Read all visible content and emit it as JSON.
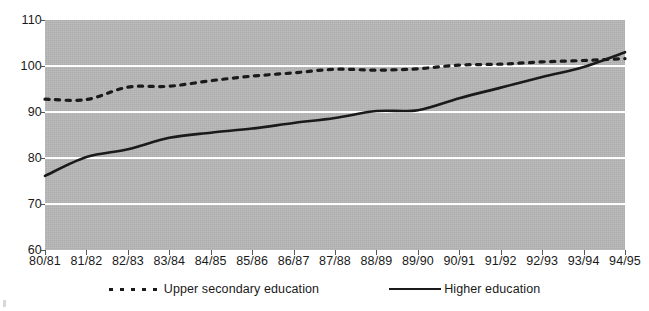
{
  "chart_data": {
    "type": "line",
    "title": "",
    "subtitle": "",
    "xlabel": "",
    "ylabel": "",
    "grid": "horizontal",
    "legend_position": "bottom-center",
    "ylim": [
      60,
      110
    ],
    "yticks": [
      60,
      70,
      80,
      90,
      100,
      110
    ],
    "categories": [
      "80/81",
      "81/82",
      "82/83",
      "83/84",
      "84/85",
      "85/86",
      "86/87",
      "87/88",
      "88/89",
      "89/90",
      "90/91",
      "91/92",
      "92/93",
      "93/94",
      "94/95"
    ],
    "series": [
      {
        "name": "Upper secondary education",
        "style": "dotted",
        "color": "#1a1a1a",
        "values": [
          92.8,
          92.7,
          95.4,
          95.6,
          96.8,
          97.8,
          98.5,
          99.3,
          99.1,
          99.4,
          100.2,
          100.4,
          100.9,
          101.2,
          101.6
        ]
      },
      {
        "name": "Higher education",
        "style": "solid",
        "color": "#1a1a1a",
        "values": [
          76.1,
          80.2,
          81.9,
          84.4,
          85.5,
          86.4,
          87.6,
          88.7,
          90.2,
          90.4,
          93.0,
          95.3,
          97.6,
          99.8,
          103.0
        ]
      }
    ]
  },
  "legend": {
    "entries": [
      {
        "label": "Upper secondary education",
        "style": "dotted"
      },
      {
        "label": "Higher education",
        "style": "solid"
      }
    ]
  },
  "colors": {
    "plot_background": "#b7b7b7",
    "gridline": "#ffffff",
    "line": "#1a1a1a",
    "text": "#1a1a1a"
  }
}
